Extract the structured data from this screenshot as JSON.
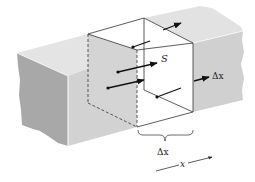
{
  "diagram": {
    "labels": {
      "surface": "S",
      "thickness_right": "Δx",
      "brace_label": "Δx",
      "axis": "x"
    },
    "colors": {
      "slab_top": "#e6e6e6",
      "slab_front": "#d4d4d4",
      "slab_end": "#a9a9a9",
      "cube_face": "#ffffff",
      "edge": "#333333",
      "arrow": "#111111"
    },
    "arrows": [
      {
        "name": "arrow-top-face",
        "from": [
          133,
          47
        ],
        "to": [
          150,
          41
        ],
        "dot": true,
        "head": false
      },
      {
        "name": "arrow-top-exit",
        "from": [
          163,
          30
        ],
        "to": [
          181,
          23
        ],
        "dot": false,
        "head": true
      },
      {
        "name": "arrow-to-s",
        "from": [
          118,
          72
        ],
        "to": [
          157,
          63
        ],
        "dot": true,
        "head": true
      },
      {
        "name": "arrow-mid",
        "from": [
          108,
          88
        ],
        "to": [
          144,
          80
        ],
        "dot": true,
        "head": true
      },
      {
        "name": "arrow-lower",
        "from": [
          157,
          97
        ],
        "to": [
          181,
          88
        ],
        "dot": true,
        "head": false
      },
      {
        "name": "arrow-right-exit",
        "from": [
          194,
          81
        ],
        "to": [
          209,
          77
        ],
        "dot": false,
        "head": true
      }
    ]
  }
}
